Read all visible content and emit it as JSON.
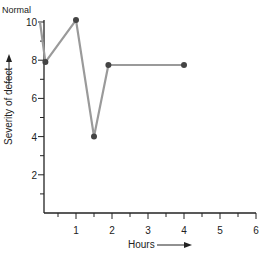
{
  "chart_data": {
    "type": "line",
    "title": "",
    "annotation": "Normal",
    "xlabel": "Hours",
    "ylabel": "Severity of defect",
    "x_ticks": [
      "1",
      "2",
      "3",
      "4",
      "5",
      "6"
    ],
    "y_ticks": [
      "2",
      "4",
      "6",
      "8",
      "10"
    ],
    "xlim": [
      0,
      6
    ],
    "ylim": [
      0,
      10
    ],
    "grid": false,
    "series": [
      {
        "name": "Severity",
        "x": [
          0,
          0.15,
          1.0,
          1.5,
          1.9,
          4.0
        ],
        "y": [
          10,
          7.9,
          10.1,
          4.0,
          7.75,
          7.75
        ],
        "markers": [
          false,
          true,
          true,
          true,
          true,
          true
        ],
        "line_color": "#9a9a9a",
        "marker_color": "#444444"
      }
    ]
  }
}
